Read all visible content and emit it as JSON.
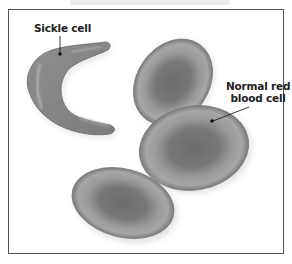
{
  "figure": {
    "labels": {
      "sickle_cell": "Sickle cell",
      "normal_rbc_line1": "Normal red",
      "normal_rbc_line2": "blood cell"
    },
    "colors": {
      "cell_fill": "#8a8a8a",
      "cell_center": "#6e6e6e",
      "cell_rim": "#a8a8a8",
      "border": "#555555",
      "background": "#ffffff"
    },
    "cells": [
      {
        "type": "sickle",
        "label": "Sickle cell"
      },
      {
        "type": "normal",
        "position": "upper-middle"
      },
      {
        "type": "normal",
        "position": "center-right",
        "label": "Normal red blood cell"
      },
      {
        "type": "normal",
        "position": "lower-left"
      }
    ]
  }
}
